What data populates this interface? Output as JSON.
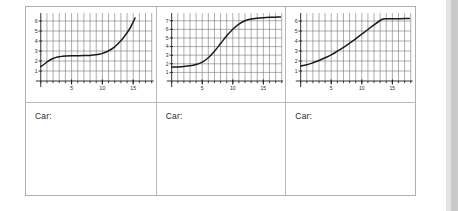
{
  "worksheet": {
    "answer_prompt": "Car:",
    "answer_prompts": [
      "Car:",
      "Car:",
      "Car:"
    ],
    "colors": {
      "page_background": "#ffffff",
      "table_border": "#b0b0b0",
      "cell_divider": "#b8b8b8",
      "grid_line": "#6b6b6b",
      "minor_grid_line": "#9a9a9a",
      "axis": "#1a1a1a",
      "curve": "#1a1a1a",
      "tick_label": "#2b2b2b",
      "margin_band": "#c9c9c9"
    }
  },
  "chart_data": [
    {
      "type": "line",
      "title": "",
      "xlabel": "",
      "ylabel": "",
      "xlim": [
        0,
        18
      ],
      "ylim": [
        0,
        6.8
      ],
      "grid": true,
      "legend": false,
      "xticks": [
        5,
        10,
        15
      ],
      "xtick_labels": [
        "5",
        "10",
        "15"
      ],
      "x_minor_step": 1,
      "yticks": [
        1,
        2,
        3,
        4,
        5,
        6
      ],
      "ytick_labels": [
        "1",
        "2",
        "3",
        "4",
        "5",
        "6"
      ],
      "x": [
        0,
        0.5,
        1,
        1.5,
        2,
        2.5,
        3,
        3.5,
        4,
        5,
        6,
        7,
        8,
        9,
        9.5,
        10,
        10.5,
        11,
        11.5,
        12,
        12.5,
        13,
        13.5,
        14,
        14.5,
        15,
        15.3
      ],
      "values": [
        1.45,
        1.65,
        1.9,
        2.1,
        2.25,
        2.36,
        2.43,
        2.47,
        2.5,
        2.52,
        2.53,
        2.54,
        2.56,
        2.62,
        2.68,
        2.76,
        2.88,
        3.02,
        3.2,
        3.42,
        3.7,
        4.02,
        4.4,
        4.82,
        5.3,
        5.9,
        6.3
      ]
    },
    {
      "type": "line",
      "title": "",
      "xlabel": "",
      "ylabel": "",
      "xlim": [
        0,
        18
      ],
      "ylim": [
        0,
        7.9
      ],
      "grid": true,
      "legend": false,
      "xticks": [
        5,
        10,
        15
      ],
      "xtick_labels": [
        "5",
        "10",
        "15"
      ],
      "x_minor_step": 1,
      "yticks": [
        1,
        2,
        3,
        4,
        5,
        6,
        7
      ],
      "ytick_labels": [
        "1",
        "2",
        "3",
        "4",
        "5",
        "6",
        "7"
      ],
      "x": [
        0,
        1,
        2,
        3,
        4,
        5,
        6,
        7,
        8,
        9,
        10,
        11,
        12,
        13,
        14,
        15,
        16,
        17,
        17.8
      ],
      "values": [
        1.62,
        1.64,
        1.68,
        1.76,
        1.92,
        2.2,
        2.7,
        3.45,
        4.35,
        5.25,
        6.02,
        6.62,
        7.0,
        7.2,
        7.3,
        7.36,
        7.4,
        7.42,
        7.44
      ]
    },
    {
      "type": "line",
      "title": "",
      "xlabel": "",
      "ylabel": "",
      "xlim": [
        0,
        18
      ],
      "ylim": [
        0,
        6.8
      ],
      "grid": true,
      "legend": false,
      "xticks": [
        5,
        10,
        15
      ],
      "xtick_labels": [
        "5",
        "10",
        "15"
      ],
      "x_minor_step": 1,
      "yticks": [
        1,
        2,
        3,
        4,
        5,
        6
      ],
      "ytick_labels": [
        "1",
        "2",
        "3",
        "4",
        "5",
        "6"
      ],
      "x": [
        0,
        1,
        2,
        3,
        4,
        5,
        6,
        7,
        8,
        9,
        10,
        11,
        12,
        13,
        13.5,
        14,
        15,
        16,
        17,
        17.8
      ],
      "values": [
        1.5,
        1.62,
        1.82,
        2.05,
        2.32,
        2.62,
        2.98,
        3.36,
        3.78,
        4.22,
        4.68,
        5.15,
        5.62,
        6.05,
        6.2,
        6.22,
        6.22,
        6.23,
        6.24,
        6.25
      ]
    }
  ]
}
